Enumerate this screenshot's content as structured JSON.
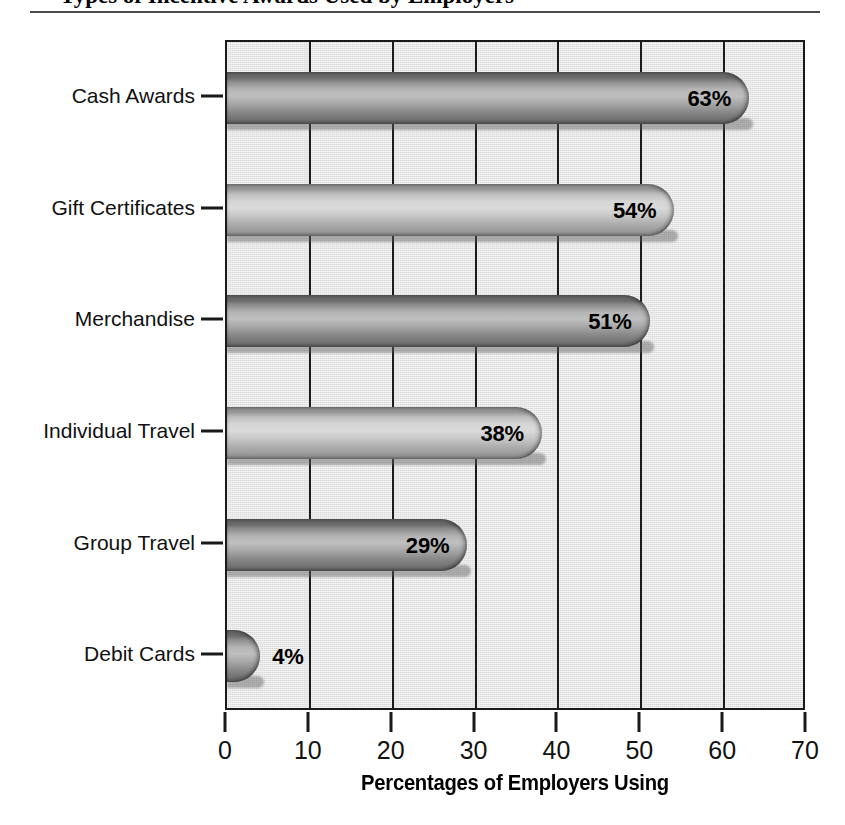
{
  "title": {
    "text": "Types of Incentive Awards Used by Employers",
    "cropped": true
  },
  "chart_data": {
    "type": "bar",
    "orientation": "horizontal",
    "title": "",
    "xlabel": "Percentages of Employers Using",
    "ylabel": "",
    "xlim": [
      0,
      70
    ],
    "xticks": [
      "0",
      "10",
      "20",
      "30",
      "40",
      "50",
      "60",
      "70"
    ],
    "grid": true,
    "grid_axis": "x",
    "legend": "none",
    "categories": [
      "Cash Awards",
      "Gift Certificates",
      "Merchandise",
      "Individual Travel",
      "Group Travel",
      "Debit Cards"
    ],
    "values": [
      63,
      54,
      51,
      38,
      29,
      4
    ],
    "data_labels": [
      "63%",
      "54%",
      "51%",
      "38%",
      "29%",
      "4%"
    ],
    "bar_shades": [
      "dark",
      "light",
      "dark",
      "light",
      "dark",
      "dark"
    ],
    "label_placement": [
      "inside",
      "inside",
      "inside",
      "inside",
      "inside",
      "outside"
    ]
  },
  "colors": {
    "plot_background": "#d9d9d9",
    "axis": "#1a1a1a",
    "gridline": "#1c1c1c",
    "bar_dark": "#8a8a8a",
    "bar_light": "#c2c2c2",
    "text": "#111111",
    "page_background": "#ffffff",
    "rule": "#4a4a4a"
  }
}
